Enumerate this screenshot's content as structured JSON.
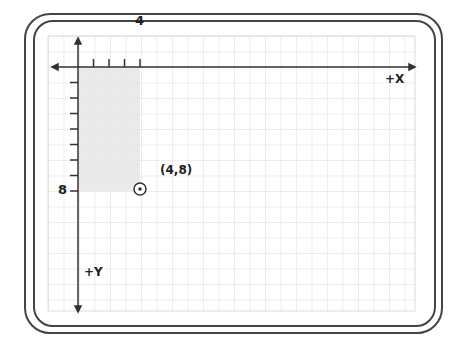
{
  "diagram": {
    "title": "",
    "axis_labels": {
      "x": "+X",
      "y": "+Y"
    },
    "tick_labels": {
      "x_marked": "4",
      "y_marked": "8"
    },
    "point": {
      "label": "(4,8)",
      "x": 4,
      "y": 8
    },
    "shaded_region": {
      "x_from": 0,
      "x_to": 4,
      "y_from": 0,
      "y_to": 8
    },
    "colors": {
      "grid": "#dcdcdc",
      "axis": "#333333",
      "shade": "#e8e8e8",
      "frame": "#444444"
    }
  }
}
